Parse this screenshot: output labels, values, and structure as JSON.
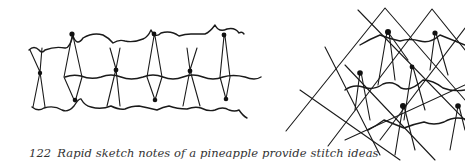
{
  "figure": {
    "number": "122",
    "caption": "Rapid sketch notes of a pineapple provide stitch ideas",
    "panels": [
      {
        "name": "left-sketch",
        "description": "horizontal band of hourglass stitches with knots and wavy connecting threads"
      },
      {
        "name": "right-sketch",
        "description": "diamond lattice with knotted stitches and wavy threads"
      }
    ],
    "ink_color": "#1a1a1a",
    "paper_color": "#ffffff"
  }
}
